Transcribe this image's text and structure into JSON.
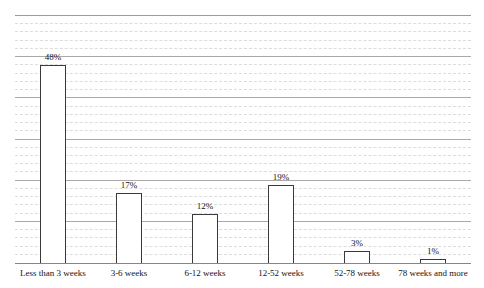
{
  "chart_data": {
    "type": "bar",
    "title": "",
    "xlabel": "",
    "ylabel": "",
    "categories": [
      "Less than 3 weeks",
      "3-6 weeks",
      "6-12 weeks",
      "12-52 weeks",
      "52-78 weeks",
      "78 weeks and more"
    ],
    "values": [
      48,
      17,
      12,
      19,
      3,
      1
    ],
    "value_labels": [
      "48%",
      "17%",
      "12%",
      "19%",
      "3%",
      "1%"
    ],
    "ylim": [
      0,
      60
    ],
    "major_gridline_step": 10,
    "minor_gridline_step": 2,
    "grid": "horizontal, major solid + minor dashed",
    "y_axis_labels_visible": false,
    "legend": "none",
    "colors": {
      "background": "#ffffff",
      "bar_fill": "#ffffff",
      "bar_border": "#3a3a3a",
      "major_gridline": "#a9a9a9",
      "minor_gridline": "#dcdcdc",
      "axis_line": "#868686",
      "text": "#141414"
    },
    "bar_width_px": 26
  }
}
